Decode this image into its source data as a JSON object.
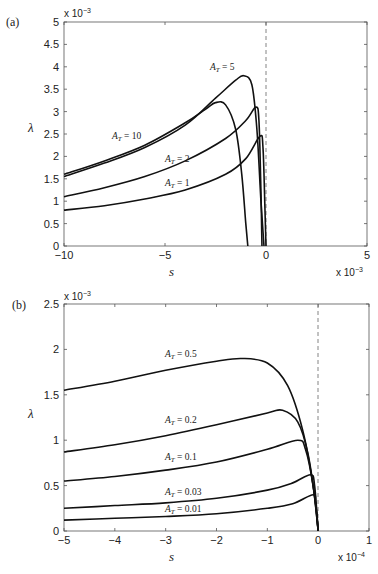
{
  "chart_data": [
    {
      "type": "line",
      "panel_label": "(a)",
      "title": "",
      "xlabel": "s",
      "ylabel": "λ",
      "x_multiplier": "x 10^-3",
      "y_multiplier": "x 10^-3",
      "xlim": [
        -10,
        5
      ],
      "ylim": [
        0,
        5
      ],
      "x_ticks": [
        "-10",
        "-5",
        "0",
        "5"
      ],
      "y_ticks": [
        "0",
        "0.5",
        "1",
        "1.5",
        "2",
        "2.5",
        "3",
        "3.5",
        "4",
        "4.5",
        "5"
      ],
      "grid": false,
      "reference_line": {
        "x": 0,
        "style": "dashed"
      },
      "series": [
        {
          "name": "A_T = 10",
          "label": "A_T = 10",
          "x": [
            -10,
            -8,
            -6,
            -4,
            -3,
            -2.5,
            -2,
            -1.5,
            -1.2,
            -1.0,
            -0.9
          ],
          "values": [
            1.6,
            1.9,
            2.25,
            2.75,
            3.05,
            3.2,
            3.15,
            2.6,
            1.6,
            0.5,
            0
          ]
        },
        {
          "name": "A_T = 5",
          "label": "A_T = 5",
          "x": [
            -10,
            -8,
            -6,
            -4,
            -2.5,
            -1.5,
            -1.1,
            -0.7,
            -0.45,
            -0.25,
            -0.1
          ],
          "values": [
            1.55,
            1.85,
            2.2,
            2.7,
            3.3,
            3.7,
            3.8,
            3.6,
            2.6,
            1.0,
            0
          ]
        },
        {
          "name": "A_T = 2",
          "label": "A_T = 2",
          "x": [
            -10,
            -8,
            -6,
            -4,
            -2,
            -1,
            -0.5,
            -0.35,
            -0.25,
            -0.2
          ],
          "values": [
            1.1,
            1.3,
            1.55,
            1.9,
            2.4,
            2.8,
            3.1,
            2.8,
            1.2,
            0
          ]
        },
        {
          "name": "A_T = 1",
          "label": "A_T = 1",
          "x": [
            -10,
            -8,
            -6,
            -4,
            -2,
            -1,
            -0.3,
            -0.15,
            -0.05,
            0
          ],
          "values": [
            0.8,
            0.9,
            1.05,
            1.25,
            1.6,
            1.95,
            2.45,
            2.2,
            0.8,
            0
          ]
        }
      ]
    },
    {
      "type": "line",
      "panel_label": "(b)",
      "title": "",
      "xlabel": "s",
      "ylabel": "λ",
      "x_multiplier": "x 10^-4",
      "y_multiplier": "x 10^-3",
      "xlim": [
        -5,
        1
      ],
      "ylim": [
        0,
        2.5
      ],
      "x_ticks": [
        "-5",
        "-4",
        "-3",
        "-2",
        "-1",
        "0",
        "1"
      ],
      "y_ticks": [
        "0",
        "0.5",
        "1",
        "1.5",
        "2",
        "2.5"
      ],
      "grid": false,
      "reference_line": {
        "x": 0,
        "style": "dashed"
      },
      "series": [
        {
          "name": "A_T = 0.5",
          "label": "A_T = 0.5",
          "x": [
            -5,
            -4,
            -3,
            -2,
            -1.5,
            -1,
            -0.6,
            -0.3,
            -0.1,
            0
          ],
          "values": [
            1.55,
            1.65,
            1.77,
            1.87,
            1.9,
            1.85,
            1.6,
            1.1,
            0.5,
            0
          ]
        },
        {
          "name": "A_T = 0.2",
          "label": "A_T = 0.2",
          "x": [
            -5,
            -4,
            -3,
            -2,
            -1,
            -0.7,
            -0.4,
            -0.2,
            -0.05,
            0
          ],
          "values": [
            0.87,
            0.95,
            1.05,
            1.17,
            1.3,
            1.33,
            1.2,
            0.85,
            0.3,
            0
          ]
        },
        {
          "name": "A_T = 0.1",
          "label": "A_T = 0.1",
          "x": [
            -5,
            -4,
            -3,
            -2,
            -1,
            -0.4,
            -0.25,
            -0.1,
            0
          ],
          "values": [
            0.55,
            0.6,
            0.67,
            0.76,
            0.9,
            1.0,
            0.9,
            0.5,
            0
          ]
        },
        {
          "name": "A_T = 0.03",
          "label": "A_T = 0.03",
          "x": [
            -5,
            -4,
            -3,
            -2,
            -1,
            -0.5,
            -0.15,
            -0.07,
            0
          ],
          "values": [
            0.25,
            0.28,
            0.31,
            0.36,
            0.45,
            0.53,
            0.62,
            0.5,
            0
          ]
        },
        {
          "name": "A_T = 0.01",
          "label": "A_T = 0.01",
          "x": [
            -5,
            -4,
            -3,
            -2,
            -1,
            -0.5,
            -0.1,
            -0.05,
            0
          ],
          "values": [
            0.12,
            0.14,
            0.16,
            0.19,
            0.25,
            0.3,
            0.4,
            0.3,
            0
          ]
        }
      ]
    }
  ],
  "panels": {
    "a": {
      "label": "(a)",
      "ylabel": "λ",
      "xlabel": "s",
      "y_mult_base": "x 10",
      "y_mult_exp": "−3",
      "x_mult_base": "x 10",
      "x_mult_exp": "−3",
      "xticks": [
        "−10",
        "−5",
        "0",
        "5"
      ],
      "yticks": [
        "0",
        "0.5",
        "1",
        "1.5",
        "2",
        "2.5",
        "3",
        "3.5",
        "4",
        "4.5",
        "5"
      ],
      "curve_labels": [
        "A",
        "T",
        " = 10",
        " = 5",
        " = 2",
        " = 1"
      ]
    },
    "b": {
      "label": "(b)",
      "ylabel": "λ",
      "xlabel": "s",
      "y_mult_base": "x 10",
      "y_mult_exp": "−3",
      "x_mult_base": "x 10",
      "x_mult_exp": "−4",
      "xticks": [
        "−5",
        "−4",
        "−3",
        "−2",
        "−1",
        "0",
        "1"
      ],
      "yticks": [
        "0",
        "0.5",
        "1",
        "1.5",
        "2",
        "2.5"
      ],
      "curve_labels": [
        " = 0.5",
        " = 0.2",
        " = 0.1",
        " = 0.03",
        " = 0.01"
      ]
    }
  }
}
